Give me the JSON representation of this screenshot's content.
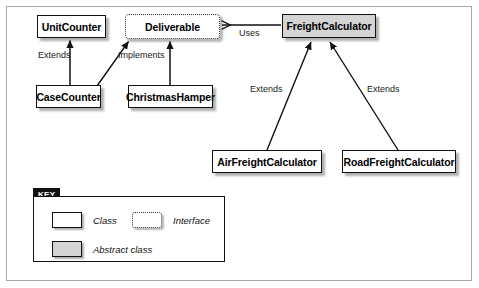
{
  "diagram": {
    "type": "uml-class-diagram",
    "background": "#ffffff",
    "frame_border_color": "#a9a9a9",
    "colors": {
      "class_fill": "#ffffff",
      "abstract_fill": "#d4d4d4",
      "interface_fill": "#ffffff",
      "stroke": "#111111",
      "key_tab_bg": "#111111",
      "key_tab_text": "#ffffff"
    },
    "nodes": [
      {
        "id": "unit_counter",
        "label": "UnitCounter",
        "kind": "class",
        "x": 37,
        "y": 15,
        "w": 69,
        "h": 23
      },
      {
        "id": "deliverable",
        "label": "Deliverable",
        "kind": "interface",
        "x": 125,
        "y": 14,
        "w": 95,
        "h": 25
      },
      {
        "id": "freight_calculator",
        "label": "FreightCalculator",
        "kind": "abstract",
        "x": 282,
        "y": 14,
        "w": 94,
        "h": 24
      },
      {
        "id": "case_counter",
        "label": "CaseCounter",
        "kind": "class",
        "x": 36,
        "y": 85,
        "w": 65,
        "h": 23
      },
      {
        "id": "christmas_hamper",
        "label": "ChristmasHamper",
        "kind": "class",
        "x": 128,
        "y": 85,
        "w": 85,
        "h": 23
      },
      {
        "id": "air_freight_calc",
        "label": "AirFreightCalculator",
        "kind": "class",
        "x": 212,
        "y": 150,
        "w": 110,
        "h": 23
      },
      {
        "id": "road_freight_calc",
        "label": "RoadFreightCalculator",
        "kind": "class",
        "x": 342,
        "y": 150,
        "w": 114,
        "h": 23
      }
    ],
    "edges": [
      {
        "id": "e_extends_unitcounter",
        "from": "case_counter",
        "to": "unit_counter",
        "label": "Extends",
        "label_x": 38,
        "label_y": 50,
        "kind": "generalization"
      },
      {
        "id": "e_implements_case",
        "from": "case_counter",
        "to": "deliverable",
        "label": "",
        "label_x": 0,
        "label_y": 0,
        "kind": "realization"
      },
      {
        "id": "e_implements_hamper",
        "from": "christmas_hamper",
        "to": "deliverable",
        "label": "Implements",
        "label_x": 118,
        "label_y": 50,
        "kind": "realization"
      },
      {
        "id": "e_uses",
        "from": "freight_calculator",
        "to": "deliverable",
        "label": "Uses",
        "label_x": 239,
        "label_y": 28,
        "kind": "dependency"
      },
      {
        "id": "e_extends_air",
        "from": "air_freight_calc",
        "to": "freight_calculator",
        "label": "Extends",
        "label_x": 250,
        "label_y": 84,
        "kind": "generalization"
      },
      {
        "id": "e_extends_road",
        "from": "road_freight_calc",
        "to": "freight_calculator",
        "label": "Extends",
        "label_x": 367,
        "label_y": 84,
        "kind": "generalization"
      }
    ]
  },
  "key": {
    "title": "KEY",
    "entries": [
      {
        "id": "legend_class",
        "label": "Class",
        "swatch": "class",
        "x": 18,
        "y": 15
      },
      {
        "id": "legend_interface",
        "label": "Interface",
        "swatch": "interface",
        "x": 98,
        "y": 15
      },
      {
        "id": "legend_abstract",
        "label": "Abstract class",
        "swatch": "abstract",
        "x": 18,
        "y": 44
      }
    ]
  }
}
